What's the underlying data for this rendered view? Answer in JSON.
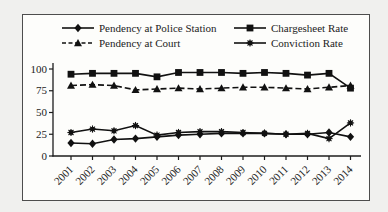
{
  "page": {
    "background": "#f0f0ee"
  },
  "figure": {
    "border_color": "#4d4d4d",
    "background": "#fdfdfb"
  },
  "legend": {
    "position": "top",
    "order": [
      0,
      2,
      1,
      3
    ]
  },
  "chart_data": {
    "type": "line",
    "title": "",
    "xlabel": "",
    "ylabel": "",
    "x": [
      "2001",
      "2002",
      "2003",
      "2004",
      "2005",
      "2006",
      "2007",
      "2008",
      "2009",
      "2010",
      "2011",
      "2012",
      "2013",
      "2014"
    ],
    "ylim": [
      0,
      100
    ],
    "yticks": [
      0,
      25,
      50,
      75,
      100
    ],
    "grid": false,
    "series_color": "#111111",
    "series": [
      {
        "name": "Pendency at Police Station",
        "marker": "diamond",
        "line": "solid",
        "values": [
          15,
          14,
          19,
          20,
          22,
          24,
          25,
          26,
          26,
          26,
          25,
          25,
          27,
          22
        ]
      },
      {
        "name": "Pendency at Court",
        "marker": "triangle",
        "line": "dashed",
        "values": [
          81,
          82,
          81,
          76,
          77,
          78,
          77,
          78,
          79,
          79,
          78,
          77,
          79,
          81
        ]
      },
      {
        "name": "Chargesheet Rate",
        "marker": "square",
        "line": "solid",
        "values": [
          94,
          95,
          95,
          95,
          91,
          96,
          96,
          96,
          95,
          96,
          95,
          93,
          95,
          78
        ]
      },
      {
        "name": "Conviction Rate",
        "marker": "asterisk",
        "line": "solid",
        "values": [
          27,
          31,
          29,
          35,
          24,
          27,
          28,
          28,
          27,
          26,
          25,
          26,
          20,
          38
        ]
      }
    ]
  }
}
